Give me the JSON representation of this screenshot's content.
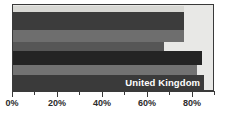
{
  "chart_data": {
    "type": "bar",
    "orientation": "horizontal",
    "title": "",
    "xlabel": "",
    "ylabel": "",
    "xlim": [
      0,
      90
    ],
    "grid": false,
    "legend": "none",
    "tick_labels": [
      "0%",
      "20%",
      "40%",
      "60%",
      "80%"
    ],
    "tick_values": [
      0,
      20,
      40,
      60,
      80
    ],
    "minor_tick_values": [
      10,
      30,
      50,
      70,
      90
    ],
    "categories": [
      "",
      "",
      "",
      "",
      "",
      "",
      "United Kingdom"
    ],
    "values": [
      77,
      77,
      77,
      68,
      85,
      83,
      86
    ],
    "annotations": [
      {
        "text": "United Kingdom",
        "bar_index": 6
      }
    ],
    "series": [
      {
        "name": "share",
        "values": [
          77,
          77,
          77,
          68,
          85,
          83,
          86
        ]
      }
    ]
  },
  "chart": {
    "bars": [
      {
        "value": 77,
        "color": "#d8d8d4",
        "label": "",
        "top": 1,
        "height": 6
      },
      {
        "value": 77,
        "color": "#3c3c3c",
        "label": "",
        "top": 7,
        "height": 18
      },
      {
        "value": 77,
        "color": "#6e6e6e",
        "label": "",
        "top": 25,
        "height": 12
      },
      {
        "value": 68,
        "color": "#565656",
        "label": "",
        "top": 37,
        "height": 9
      },
      {
        "value": 85,
        "color": "#242424",
        "label": "",
        "top": 46,
        "height": 14
      },
      {
        "value": 83,
        "color": "#727272",
        "label": "",
        "top": 60,
        "height": 10
      },
      {
        "value": 86,
        "color": "#3a3a3a",
        "label": "United Kingdom",
        "top": 70,
        "height": 16
      }
    ],
    "axis": {
      "max": 90,
      "ticks": [
        {
          "value": 0,
          "label": "0%",
          "major": true
        },
        {
          "value": 10,
          "label": "",
          "major": false
        },
        {
          "value": 20,
          "label": "20%",
          "major": true
        },
        {
          "value": 30,
          "label": "",
          "major": false
        },
        {
          "value": 40,
          "label": "40%",
          "major": true
        },
        {
          "value": 50,
          "label": "",
          "major": false
        },
        {
          "value": 60,
          "label": "60%",
          "major": true
        },
        {
          "value": 70,
          "label": "",
          "major": false
        },
        {
          "value": 80,
          "label": "80%",
          "major": true
        },
        {
          "value": 90,
          "label": "",
          "major": false
        }
      ]
    },
    "colors": {
      "frame": "#3a3a3a",
      "plot_background": "#e8e8e6",
      "page_background": "#ffffff",
      "label_text": "#2b2b2b",
      "bar_label_text": "#ffffff"
    }
  }
}
